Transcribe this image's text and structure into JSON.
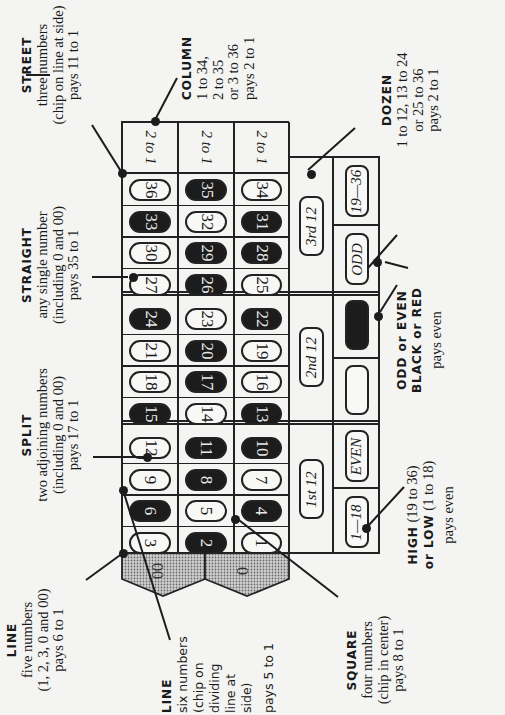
{
  "diagram": {
    "orientation": "rotated 90 degrees (landscape printed page)",
    "columns_header": [
      "2 to 1",
      "2 to 1",
      "2 to 1"
    ],
    "number_grid": {
      "rows": [
        [
          36,
          35,
          34
        ],
        [
          33,
          32,
          31
        ],
        [
          30,
          29,
          28
        ],
        [
          27,
          26,
          25
        ],
        [
          24,
          23,
          22
        ],
        [
          21,
          20,
          19
        ],
        [
          18,
          17,
          16
        ],
        [
          15,
          14,
          13
        ],
        [
          12,
          11,
          10
        ],
        [
          9,
          8,
          7
        ],
        [
          6,
          5,
          4
        ],
        [
          3,
          2,
          1
        ]
      ],
      "colors": {
        "36": "white",
        "35": "black",
        "34": "white",
        "33": "black",
        "32": "white",
        "31": "black",
        "30": "white",
        "29": "black",
        "28": "black",
        "27": "white",
        "26": "black",
        "25": "white",
        "24": "black",
        "23": "white",
        "22": "black",
        "21": "white",
        "20": "black",
        "19": "white",
        "18": "white",
        "17": "black",
        "16": "white",
        "15": "black",
        "14": "white",
        "13": "black",
        "12": "white",
        "11": "black",
        "10": "black",
        "9": "white",
        "8": "black",
        "7": "white",
        "6": "black",
        "5": "white",
        "4": "black",
        "3": "white",
        "2": "black",
        "1": "white"
      }
    },
    "zeros": [
      "00",
      "0"
    ],
    "dozens": [
      "3rd 12",
      "2nd 12",
      "1st 12"
    ],
    "even_money": [
      "19—36",
      "ODD",
      "BLACK",
      "RED",
      "EVEN",
      "1—18"
    ],
    "palette": {
      "black_cell": "#1c1c1c",
      "paper": "#f4f4f2",
      "zero_fill": "#b8b8b8",
      "line": "#222222"
    }
  },
  "callouts": {
    "street": {
      "title": "STREET",
      "lines": [
        "three numbers",
        "(chip on line at side)",
        "pays 11 to 1"
      ]
    },
    "column": {
      "title": "COLUMN",
      "lines": [
        "1 to 34,",
        "2 to 35",
        "or 3 to 36",
        "pays 2 to 1"
      ]
    },
    "dozen": {
      "title": "DOZEN",
      "lines": [
        "1 to 12, 13 to 24",
        "or 25 to 36",
        "pays 2 to 1"
      ]
    },
    "straight": {
      "title": "STRAIGHT",
      "lines": [
        "any single number",
        "(including 0 and 00)",
        "pays 35 to 1"
      ]
    },
    "odd_even": {
      "title1": "ODD or EVEN",
      "title2": "BLACK or RED",
      "lines": [
        "pays even"
      ]
    },
    "split": {
      "title": "SPLIT",
      "lines": [
        "two adjoining numbers",
        "(including 0 and 00)",
        "pays 17 to 1"
      ]
    },
    "high_low": {
      "title1": "HIGH",
      "title1_rest": " (19 to 36)",
      "title2": "or LOW",
      "title2_rest": " (1 to 18)",
      "lines": [
        "pays even"
      ]
    },
    "line_five": {
      "title": "LINE",
      "lines": [
        "five numbers",
        "(1, 2, 3, 0 and 00)",
        "pays 6 to 1"
      ]
    },
    "line_six": {
      "title": "LINE",
      "lines": [
        "six numbers",
        "(chip on",
        "dividing",
        "line at",
        "side)",
        "pays 5 to 1"
      ]
    },
    "square": {
      "title": "SQUARE",
      "lines": [
        "four numbers",
        "(chip in center)",
        "pays 8 to 1"
      ]
    }
  }
}
